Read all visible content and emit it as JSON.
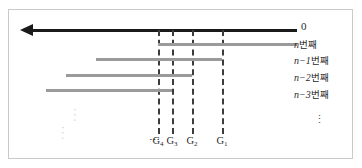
{
  "figure": {
    "axis": {
      "name": "time-axis",
      "direction": "left",
      "origin_label": "0"
    },
    "guides": [
      {
        "id": "G4",
        "label": "G",
        "subscript": "4",
        "x": 149
      },
      {
        "id": "G3",
        "label": "G",
        "subscript": "3",
        "x": 163
      },
      {
        "id": "G2",
        "label": "G",
        "subscript": "2",
        "x": 183
      },
      {
        "id": "G1",
        "label": "G",
        "subscript": "1",
        "x": 213
      }
    ],
    "guide_leading_ellipsis": "⋯",
    "rows": [
      {
        "label_var": "n",
        "label_suffix": "번째",
        "y": 33,
        "x_start": 149,
        "x_end": 288,
        "label_y": 30
      },
      {
        "label_var": "n−1",
        "label_suffix": "번째",
        "y": 48,
        "x_start": 87,
        "x_end": 213,
        "label_y": 46
      },
      {
        "label_var": "n−2",
        "label_suffix": "번째",
        "y": 64,
        "x_start": 57,
        "x_end": 183,
        "label_y": 63
      },
      {
        "label_var": "n−3",
        "label_suffix": "번째",
        "y": 79,
        "x_start": 37,
        "x_end": 163,
        "label_y": 80
      }
    ],
    "row_ellipsis": "⋮",
    "diagonal_ellipsis_upper": "⋰",
    "diagonal_ellipsis_lower": "⋰"
  },
  "colors": {
    "axis": "#1a1a1a",
    "segment": "#9a9a9a",
    "guide": "#3c3c3c",
    "border": "#c9c9c9",
    "background": "#ffffff",
    "text": "#2a2a2a"
  }
}
